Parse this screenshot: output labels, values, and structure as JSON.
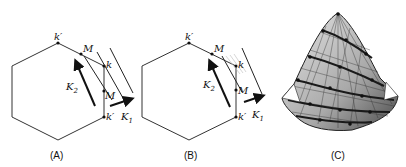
{
  "panels": [
    {
      "id": "A",
      "caption": "(A)",
      "labels": {
        "k_prime_top": "k′",
        "M_top": "M",
        "k": "k",
        "M_side": "M",
        "k_prime_bottom": "k′",
        "K2": "K",
        "K2_sub": "2",
        "K1": "K",
        "K1_sub": "1"
      }
    },
    {
      "id": "B",
      "caption": "(B)",
      "labels": {
        "k_prime_top": "k′",
        "M_top": "M",
        "k": "k",
        "M_side": "M",
        "k_prime_bottom": "k′",
        "K2": "K",
        "K2_sub": "2",
        "K1": "K",
        "K1_sub": "1"
      }
    },
    {
      "id": "C",
      "caption": "(C)",
      "description": "3D mesh surface (cone-like band structure)"
    }
  ],
  "colors": {
    "line": "#333333",
    "mesh_light": "#c8c8c8",
    "mesh_dark": "#2a2a2a"
  }
}
